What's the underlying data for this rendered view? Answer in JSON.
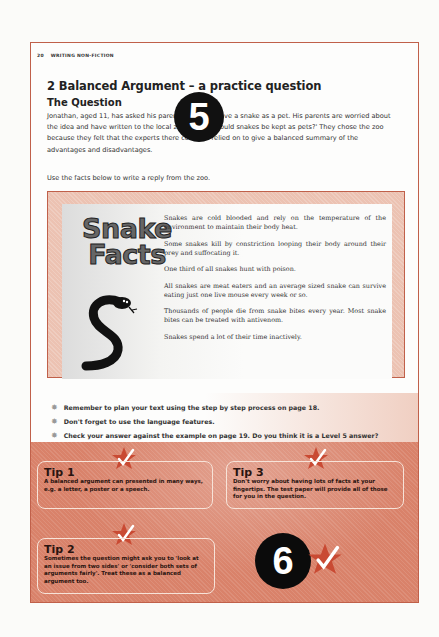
{
  "header": {
    "page_number": "20",
    "section": "WRITING NON-FICTION"
  },
  "title": "2 Balanced Argument – a practice question",
  "subtitle": "The Question",
  "intro": "Jonathan, aged 11, has asked his parents if he can have a snake as a pet. His parents are worried about the idea and have written to the local zoo asking 'should snakes be kept as pets?' They chose the zoo because they felt that the experts there could be relied on to give a balanced summary of the advantages and disadvantages.",
  "instruction": "Use the facts below to write a reply from the zoo.",
  "badge_top": "5",
  "facts": {
    "heading_line1": "Snake",
    "heading_line2": "Facts",
    "items": [
      "Snakes are cold blooded and rely on the temperature of the environment to maintain their body heat.",
      "Some snakes kill by constriction looping their body around their prey and suffocating it.",
      "One third of all snakes hunt with poison.",
      "All snakes are meat eaters and an average sized snake can survive eating just one live mouse every week or so.",
      "Thousands of people die from snake bites every year. Most snake bites can be treated with antivenom.",
      "Snakes spend a lot of their time inactively."
    ]
  },
  "reminders": [
    "Remember to plan your text using the step by step process on page 18.",
    "Don't forget to use the language features.",
    "Check your answer against the example on page 19. Do you think it is a Level 5 answer?"
  ],
  "reminder_icon": "star-bullet",
  "tips": {
    "tip1": {
      "title": "Tip 1",
      "body": "A balanced argument can presented in many ways, e.g. a letter, a poster or a speech."
    },
    "tip2": {
      "title": "Tip 2",
      "body": "Sometimes the question might ask you to 'look at an issue from two sides' or 'consider both sets of arguments fairly'. Treat these as a balanced argument too."
    },
    "tip3": {
      "title": "Tip 3",
      "body": "Don't worry about having lots of facts at your fingertips. The test paper will provide all of those for you in the question."
    }
  },
  "badge_bottom": "6",
  "colors": {
    "border": "#c0604a",
    "tips_bg": "#d9826a",
    "facts_bg": "#ecc2b2",
    "star": "#d4503a"
  }
}
